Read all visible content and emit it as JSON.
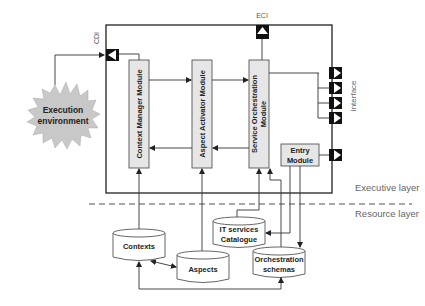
{
  "diagram": {
    "external": {
      "execution_environment": [
        "Execution",
        "environment"
      ]
    },
    "ports": {
      "cdi": "CDI",
      "eci": "ECI",
      "interface": "Interface"
    },
    "modules": {
      "context_manager": "Context Manager Module",
      "aspect_activator": "Aspect Activator Module",
      "service_orchestration": [
        "Service Orchestration",
        "Module"
      ],
      "entry": [
        "Entry",
        "Module"
      ]
    },
    "layers": {
      "executive": "Executive layer",
      "resource": "Resource layer"
    },
    "stores": {
      "contexts": "Contexts",
      "aspects": "Aspects",
      "it_services": [
        "IT services",
        "Catalogue"
      ],
      "orchestration": [
        "Orchestration",
        "schemas"
      ]
    }
  },
  "colors": {
    "module_fill": "#e6e6e6",
    "star_fill": "#c8c8c8",
    "line": "#333333",
    "label_gray": "#666666"
  }
}
